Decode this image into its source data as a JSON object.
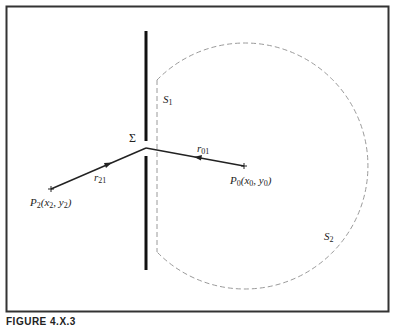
{
  "figure": {
    "caption": "FIGURE 4.X.3",
    "labels": {
      "aperture": "Σ",
      "surface1": "S",
      "surface1_sub": "1",
      "surface2": "S",
      "surface2_sub": "2",
      "r01": "r",
      "r01_sub": "01",
      "r21": "r",
      "r21_sub": "21",
      "p0": "P",
      "p0_sub": "0",
      "p0_coords": "(x",
      "p0_x_sub": "0",
      "p0_mid": ", y",
      "p0_y_sub": "0",
      "p0_end": ")",
      "p2": "P",
      "p2_sub": "2",
      "p2_coords": "(x",
      "p2_x_sub": "2",
      "p2_mid": ", y",
      "p2_y_sub": "2",
      "p2_end": ")"
    },
    "colors": {
      "frame": "#333333",
      "screen": "#111111",
      "dashed": "#9a9a9a",
      "ray": "#222222"
    }
  }
}
